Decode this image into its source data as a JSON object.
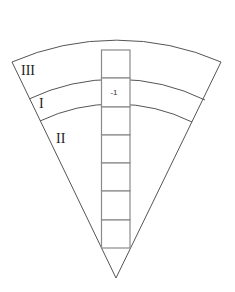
{
  "diagram": {
    "regions": [
      {
        "id": "III",
        "label": "III"
      },
      {
        "id": "I",
        "label": "I"
      },
      {
        "id": "II",
        "label": "II"
      }
    ],
    "column": {
      "cell_count": 7,
      "cells": [
        "",
        "-1",
        "",
        "",
        "",
        "",
        ""
      ]
    },
    "colors": {
      "line": "#555555",
      "column_line": "#8a8a8a",
      "background": "#ffffff"
    }
  }
}
